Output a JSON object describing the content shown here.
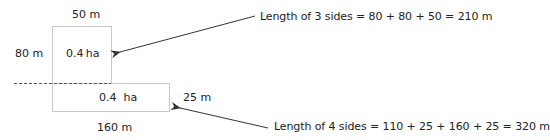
{
  "diagram": {
    "top_plot": {
      "width_label": "50 m",
      "height_label": "80 m",
      "area_label": "0.4 ha"
    },
    "bottom_plot": {
      "area_label": "0.4  ha",
      "height_label": "25 m",
      "width_label": "160 m"
    },
    "annotations": [
      {
        "text": "Length of 3 sides = 80 + 80 + 50 = 210 m",
        "points_to": "top_plot"
      },
      {
        "text": "Length of 4 sides = 110 + 25 + 160 + 25 = 320 m",
        "points_to": "bottom_plot"
      }
    ],
    "colors": {
      "box_stroke": "#c8c8c8",
      "dashed_line": "#555555",
      "arrow": "#333333",
      "text": "#222222"
    }
  }
}
